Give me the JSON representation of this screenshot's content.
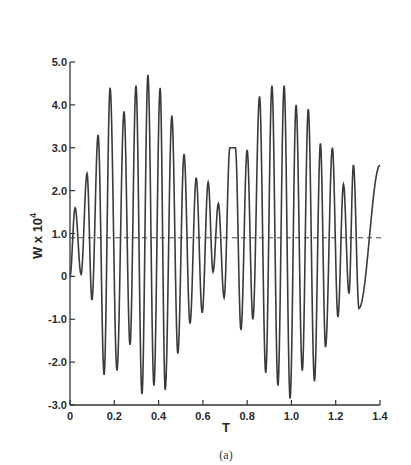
{
  "chart_data": {
    "type": "line",
    "title": "",
    "caption": "(a)",
    "xlabel": "T",
    "ylabel": "W x 10",
    "ylabel_exponent": "4",
    "xlim": [
      0,
      1.4
    ],
    "ylim": [
      -3.0,
      5.0
    ],
    "x_ticks": [
      "0",
      "0.2",
      "0.4",
      "0.6",
      "0.8",
      "1.0",
      "1.2",
      "1.4"
    ],
    "y_ticks": [
      "5.0",
      "4.0",
      "3.0",
      "2.0",
      "1.0",
      "0",
      "-1.0",
      "-2.0",
      "-3.0"
    ],
    "grid": false,
    "reference_line": {
      "style": "dashed",
      "y": 0.9
    },
    "series": [
      {
        "name": "W",
        "description": "beating oscillation; local extrema (T, W)",
        "extrema": [
          [
            0.0,
            0.0
          ],
          [
            0.023,
            1.6
          ],
          [
            0.05,
            0.05
          ],
          [
            0.077,
            2.4
          ],
          [
            0.099,
            -0.55
          ],
          [
            0.127,
            3.3
          ],
          [
            0.154,
            -2.3
          ],
          [
            0.181,
            4.4
          ],
          [
            0.212,
            -2.2
          ],
          [
            0.244,
            3.85
          ],
          [
            0.271,
            -1.6
          ],
          [
            0.298,
            4.45
          ],
          [
            0.325,
            -2.75
          ],
          [
            0.352,
            4.7
          ],
          [
            0.379,
            -2.55
          ],
          [
            0.407,
            4.4
          ],
          [
            0.43,
            -2.65
          ],
          [
            0.46,
            3.75
          ],
          [
            0.487,
            -1.8
          ],
          [
            0.515,
            2.85
          ],
          [
            0.542,
            -1.1
          ],
          [
            0.57,
            2.3
          ],
          [
            0.597,
            -0.85
          ],
          [
            0.624,
            2.2
          ],
          [
            0.646,
            0.1
          ],
          [
            0.67,
            1.7
          ],
          [
            0.696,
            -0.5
          ],
          [
            0.722,
            3.0
          ],
          [
            0.772,
            -1.25
          ],
          [
            0.747,
            3.0
          ],
          [
            0.8,
            2.95
          ],
          [
            0.826,
            -1.0
          ],
          [
            0.856,
            4.2
          ],
          [
            0.884,
            -2.25
          ],
          [
            0.912,
            4.45
          ],
          [
            0.939,
            -2.55
          ],
          [
            0.967,
            4.45
          ],
          [
            0.994,
            -2.85
          ],
          [
            1.021,
            4.0
          ],
          [
            1.049,
            -2.2
          ],
          [
            1.076,
            3.9
          ],
          [
            1.104,
            -2.45
          ],
          [
            1.131,
            3.1
          ],
          [
            1.154,
            -1.65
          ],
          [
            1.185,
            3.0
          ],
          [
            1.21,
            -0.95
          ],
          [
            1.235,
            2.15
          ],
          [
            1.26,
            -0.4
          ],
          [
            1.28,
            2.6
          ],
          [
            1.305,
            -0.75
          ],
          [
            1.4,
            2.6
          ]
        ]
      }
    ]
  }
}
